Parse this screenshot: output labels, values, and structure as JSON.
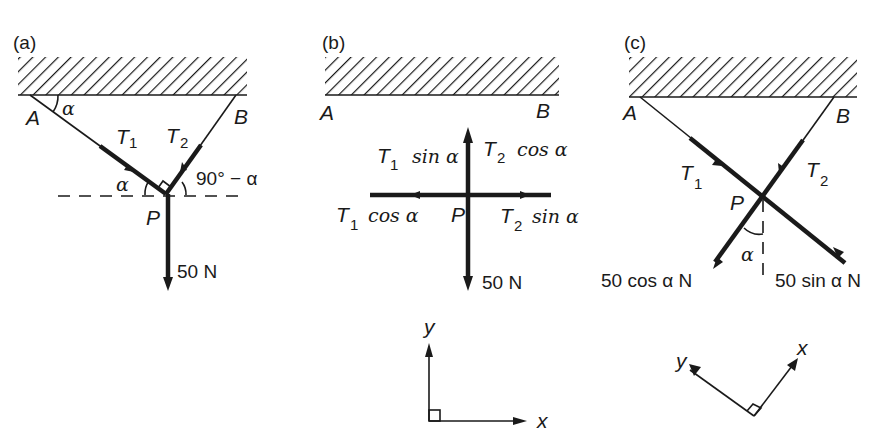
{
  "panels": [
    {
      "id": "a",
      "label": "(a)",
      "point_a": "A",
      "point_b": "B",
      "point_p": "P",
      "tension_1": "T",
      "tension_1_sub": "1",
      "tension_2": "T",
      "tension_2_sub": "2",
      "angle_at_a": "α",
      "angle_at_p_left": "α",
      "angle_at_p_right": "90° − α",
      "weight": "50 N"
    },
    {
      "id": "b",
      "label": "(b)",
      "point_a": "A",
      "point_b": "B",
      "point_p": "P",
      "up_left": "T",
      "up_left_sub": "1",
      "up_left_fn": "sin α",
      "up_right": "T",
      "up_right_sub": "2",
      "up_right_fn": "cos α",
      "left": "T",
      "left_sub": "1",
      "left_fn": "cos α",
      "right": "T",
      "right_sub": "2",
      "right_fn": "sin α",
      "weight": "50 N",
      "axes": {
        "x": "x",
        "y": "y"
      }
    },
    {
      "id": "c",
      "label": "(c)",
      "point_a": "A",
      "point_b": "B",
      "point_p": "P",
      "tension_1": "T",
      "tension_1_sub": "1",
      "tension_2": "T",
      "tension_2_sub": "2",
      "angle": "α",
      "component_left": "50 cos α N",
      "component_right": "50 sin α N",
      "axes": {
        "x": "x",
        "y": "y"
      }
    }
  ]
}
